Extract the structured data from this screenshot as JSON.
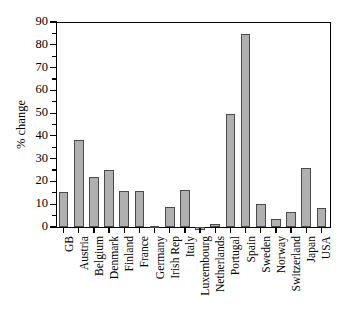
{
  "chart_data": {
    "type": "bar",
    "title": "",
    "subtitle": "",
    "xlabel": "",
    "ylabel": "% change",
    "ylim": [
      0,
      90
    ],
    "yticks": [
      0,
      10,
      20,
      30,
      40,
      50,
      60,
      70,
      80,
      90
    ],
    "ytick_labels": [
      "0",
      "10",
      "20",
      "30",
      "40",
      "50",
      "60",
      "70",
      "80",
      "90"
    ],
    "grid": false,
    "legend": null,
    "bar_color": "#b0b0b0",
    "bar_edge_color": "#4a4a4a",
    "categories": [
      "GB",
      "Austria",
      "Belgium",
      "Denmark",
      "Finland",
      "France",
      "Germany",
      "Irish Rep",
      "Italy",
      "Luxembourg",
      "Netherlands",
      "Portugal",
      "Spain",
      "Sweden",
      "Norway",
      "Switzerland",
      "Japan",
      "USA"
    ],
    "values": [
      15.2,
      38.1,
      21.8,
      25.2,
      15.7,
      15.7,
      0.3,
      8.9,
      16.2,
      -1.5,
      1.3,
      49.4,
      84.7,
      10.0,
      3.3,
      6.4,
      26.0,
      8.2
    ]
  }
}
